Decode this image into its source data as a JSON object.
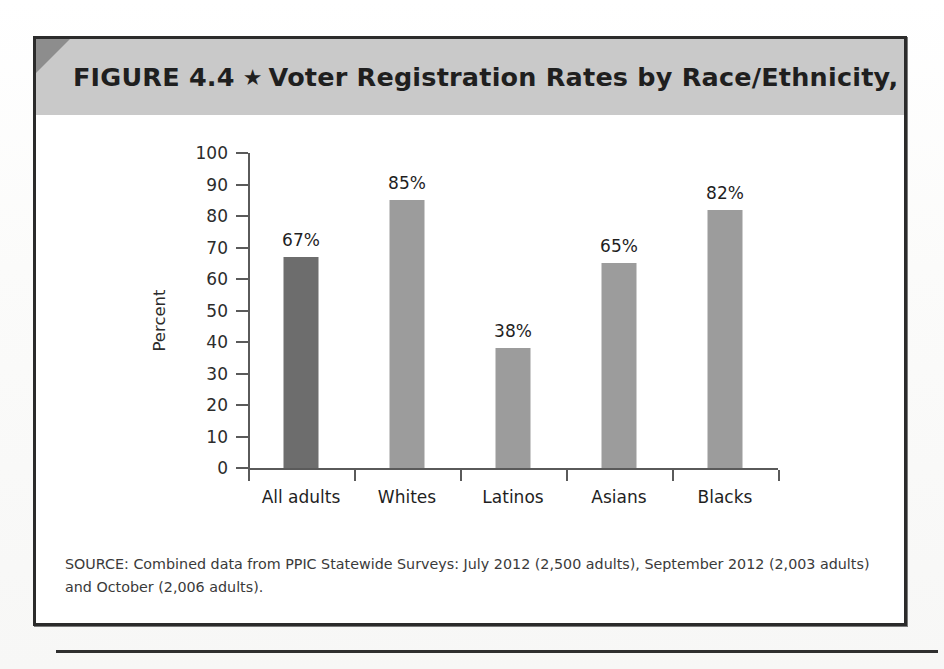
{
  "figure": {
    "label": "FIGURE 4.4",
    "separator_icon": "star-icon",
    "separator_glyph": "★",
    "title": "Voter Registration Rates by Race/Ethnicity, 2012"
  },
  "source": {
    "text": "SOURCE: Combined data from PPIC Statewide Surveys: July 2012 (2,500 adults), September 2012 (2,003 adults) and October (2,006 adults)."
  },
  "colors": {
    "header_band": "#c9c9c9",
    "corner_fold": "#8d8d8d",
    "bar_default": "#9c9c9c",
    "bar_highlight": "#6d6d6d",
    "axis": "#5a5a5a",
    "border": "#2b2b2b"
  },
  "chart_data": {
    "type": "bar",
    "title": "Voter Registration Rates by Race/Ethnicity, 2012",
    "xlabel": "",
    "ylabel": "Percent",
    "ylim": [
      0,
      100
    ],
    "yticks": [
      0,
      10,
      20,
      30,
      40,
      50,
      60,
      70,
      80,
      90,
      100
    ],
    "ytick_labels": [
      "0",
      "10",
      "20",
      "30",
      "40",
      "50",
      "60",
      "70",
      "80",
      "90",
      "100"
    ],
    "grid": false,
    "legend": null,
    "categories": [
      "All adults",
      "Whites",
      "Latinos",
      "Asians",
      "Blacks"
    ],
    "values": [
      67,
      85,
      38,
      65,
      82
    ],
    "data_labels": [
      "67%",
      "85%",
      "38%",
      "65%",
      "82%"
    ],
    "bar_colors": [
      "#6d6d6d",
      "#9c9c9c",
      "#9c9c9c",
      "#9c9c9c",
      "#9c9c9c"
    ]
  }
}
